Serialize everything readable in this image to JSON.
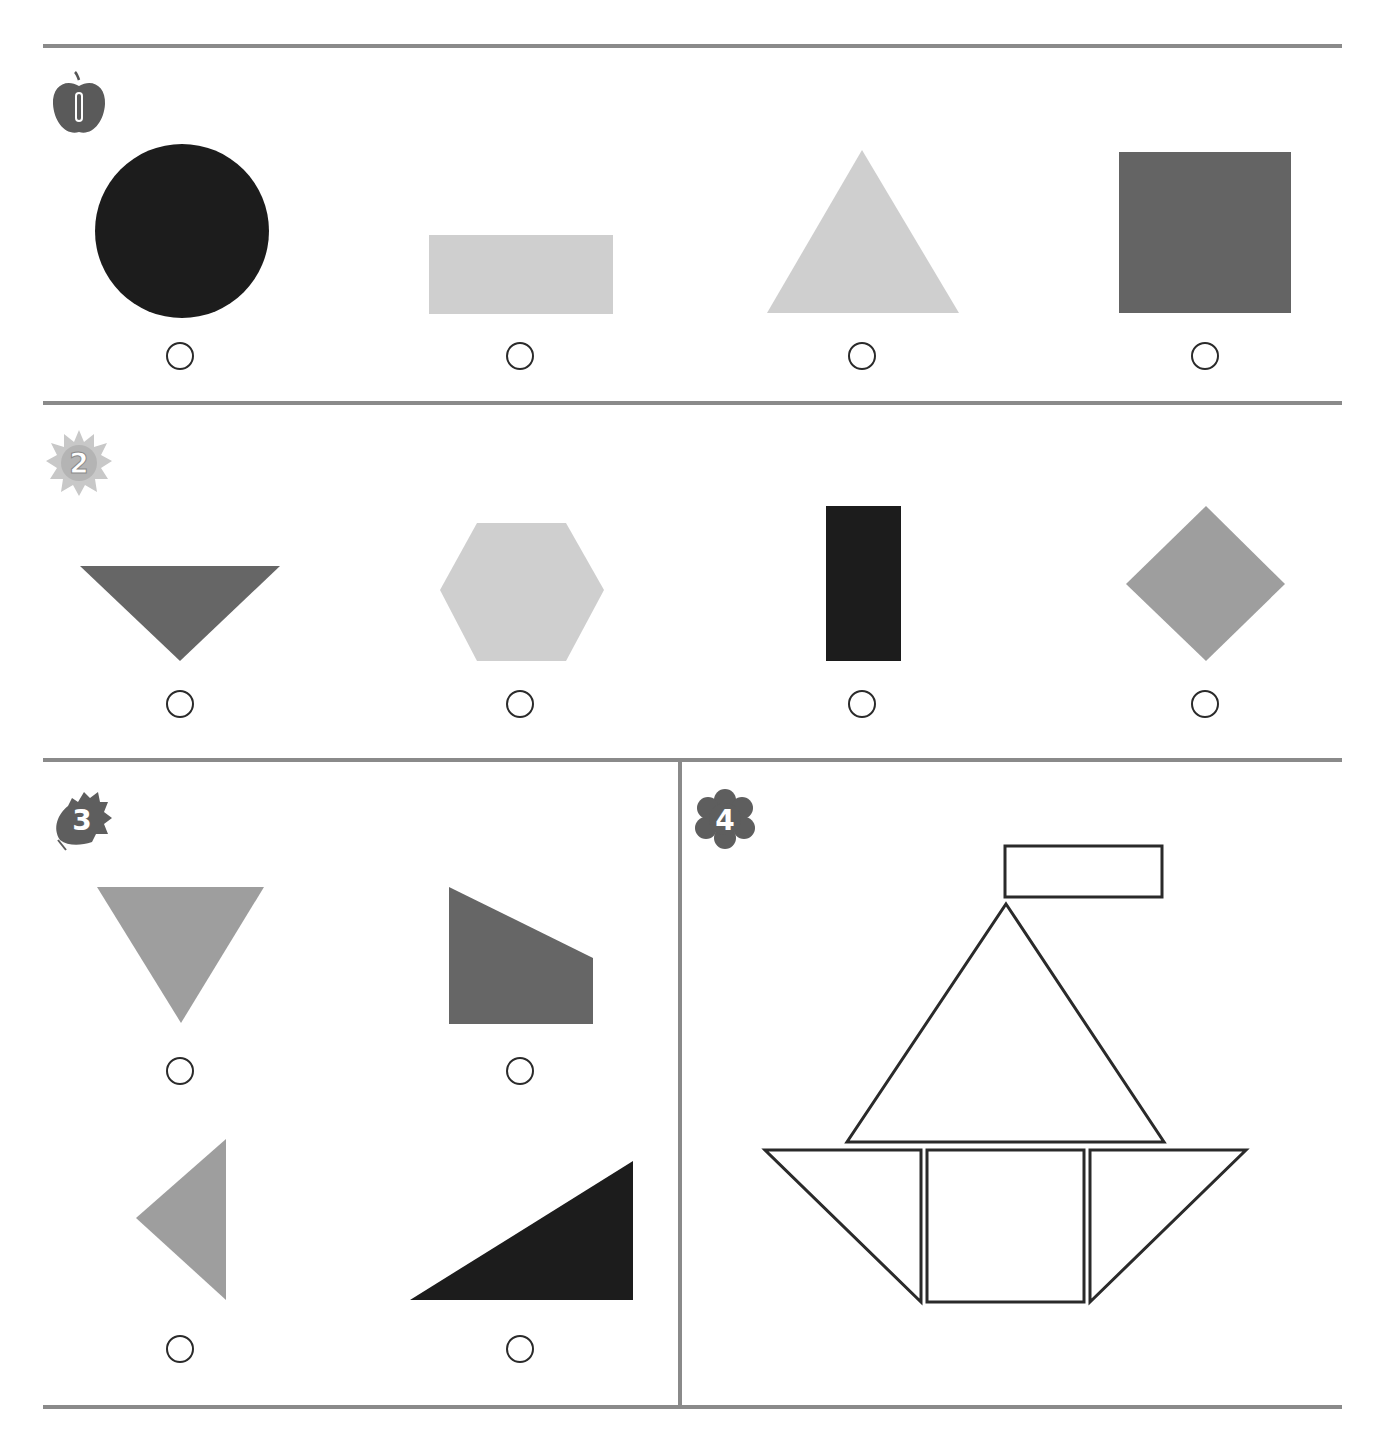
{
  "worksheet": {
    "colors": {
      "divider": "#8a8a8a",
      "black": "#1c1c1c",
      "dark_gray": "#646464",
      "medium_gray": "#9e9e9e",
      "light_gray": "#cfcfcf",
      "outline": "#2a2a2a"
    },
    "dividers": {
      "horizontal_y": [
        44,
        401,
        758,
        1405
      ],
      "vertical": {
        "x": 678,
        "y_top": 758,
        "y_bottom": 1409
      }
    },
    "questions": [
      {
        "number": "1",
        "badge_icon": "apple-number-icon",
        "badge_color": "#5a5a5a",
        "badge_pos": {
          "x": 44,
          "y": 70
        },
        "options": [
          {
            "shape": "circle",
            "fill": "#1c1c1c",
            "points": null,
            "cx": 182,
            "cy": 231,
            "r": 87,
            "radio": {
              "x": 180,
              "y": 356
            }
          },
          {
            "shape": "rectangle",
            "fill": "#cfcfcf",
            "points": "429,235 613,235 613,314 429,314",
            "radio": {
              "x": 520,
              "y": 356
            }
          },
          {
            "shape": "triangle",
            "fill": "#cfcfcf",
            "points": "862,150 959,313 767,313",
            "radio": {
              "x": 862,
              "y": 356
            }
          },
          {
            "shape": "square",
            "fill": "#646464",
            "points": "1119,152 1291,152 1291,313 1119,313",
            "radio": {
              "x": 1205,
              "y": 356
            }
          }
        ]
      },
      {
        "number": "2",
        "badge_icon": "sun-number-icon",
        "badge_color": "#bdbdbd",
        "badge_pos": {
          "x": 44,
          "y": 428
        },
        "options": [
          {
            "shape": "triangle",
            "fill": "#666666",
            "points": "80,566 280,566 180,661",
            "radio": {
              "x": 180,
              "y": 704
            }
          },
          {
            "shape": "hexagon",
            "fill": "#cfcfcf",
            "points": "477,523 566,523 604,590 566,661 477,661 440,590",
            "radio": {
              "x": 520,
              "y": 704
            }
          },
          {
            "shape": "rectangle",
            "fill": "#1c1c1c",
            "points": "826,506 901,506 901,661 826,661",
            "radio": {
              "x": 862,
              "y": 704
            }
          },
          {
            "shape": "square",
            "fill": "#9e9e9e",
            "points": "1206,506 1285,584 1206,661 1126,584",
            "radio": {
              "x": 1205,
              "y": 704
            }
          }
        ]
      },
      {
        "number": "3",
        "badge_icon": "leaf-number-icon",
        "badge_color": "#5e5e5e",
        "badge_pos": {
          "x": 46,
          "y": 784
        },
        "options": [
          {
            "shape": "triangle",
            "fill": "#9e9e9e",
            "points": "97,887 264,887 181,1023",
            "radio": {
              "x": 180,
              "y": 1071
            }
          },
          {
            "shape": "trapezoid",
            "fill": "#666666",
            "points": "449,887 593,958 593,1024 449,1024",
            "radio": {
              "x": 520,
              "y": 1071
            }
          },
          {
            "shape": "triangle",
            "fill": "#9e9e9e",
            "points": "226,1139 226,1300 136,1218",
            "radio": {
              "x": 180,
              "y": 1349
            }
          },
          {
            "shape": "triangle",
            "fill": "#1c1c1c",
            "points": "633,1161 633,1300 410,1300",
            "radio": {
              "x": 520,
              "y": 1349
            }
          }
        ]
      },
      {
        "number": "4",
        "badge_icon": "flower-number-icon",
        "badge_color": "#5e5e5e",
        "badge_pos": {
          "x": 690,
          "y": 784
        },
        "boat_figure": {
          "description": "Sailboat built from outlined shapes",
          "stroke": "#2a2a2a",
          "parts": [
            {
              "shape": "rectangle",
              "name": "flag",
              "points": "1005,846 1162,846 1162,897 1005,897"
            },
            {
              "shape": "triangle",
              "name": "sail",
              "points": "1006,904 1164,1142 847,1142"
            },
            {
              "shape": "triangle",
              "name": "hull-left",
              "points": "765,1150 921,1150 921,1302"
            },
            {
              "shape": "square",
              "name": "hull-center",
              "points": "927,1150 1084,1150 1084,1302 927,1302"
            },
            {
              "shape": "triangle",
              "name": "hull-right",
              "points": "1090,1150 1246,1150 1090,1302"
            }
          ]
        }
      }
    ]
  }
}
